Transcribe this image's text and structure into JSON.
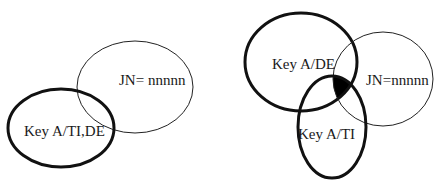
{
  "left_diagram": {
    "sets": [
      {
        "id": "jn",
        "label": "JN= nnnnn",
        "cx": 135,
        "cy": 87,
        "rx": 58,
        "ry": 46,
        "stroke_width": 1,
        "color": "#222222"
      },
      {
        "id": "key",
        "label": "Key A/TI,DE",
        "cx": 61,
        "cy": 128,
        "rx": 53,
        "ry": 39,
        "stroke_width": 3,
        "color": "#111111"
      }
    ]
  },
  "right_diagram": {
    "sets": [
      {
        "id": "key-de",
        "label": "Key A/DE",
        "cx": 301,
        "cy": 62,
        "rx": 56,
        "ry": 49,
        "stroke_width": 3,
        "color": "#111111"
      },
      {
        "id": "jn",
        "label": "JN=nnnnn",
        "cx": 383,
        "cy": 79,
        "rx": 50,
        "ry": 47,
        "stroke_width": 1,
        "color": "#222222"
      },
      {
        "id": "key-ti",
        "label": "Key A/TI",
        "cx": 332,
        "cy": 127,
        "rx": 34,
        "ry": 51,
        "stroke_width": 3,
        "color": "#111111"
      }
    ],
    "highlighted_region": "intersection of Key A/DE, JN and Key A/TI",
    "highlight_color": "#000000"
  }
}
